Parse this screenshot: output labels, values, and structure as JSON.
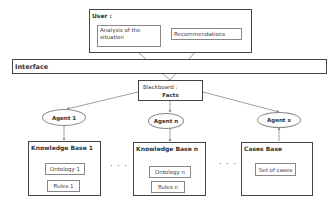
{
  "user": {
    "title": "User :",
    "analysis": "Analysis of  the situation",
    "recommendations": "Recommendations"
  },
  "interface": {
    "label": "Interface"
  },
  "blackboard": {
    "title": "Blackboard :",
    "subtitle": "Facts"
  },
  "agents": [
    {
      "label": "Agent 1"
    },
    {
      "label": "Agent n"
    },
    {
      "label": "Agent x"
    }
  ],
  "bases": [
    {
      "title": "Knowledge Base 1",
      "items": [
        "Ontology 1",
        "Rules 1"
      ]
    },
    {
      "title": "Knowledge Base n",
      "items": [
        "Ontology n",
        "Rules n"
      ]
    },
    {
      "title": "Cases Base",
      "items": [
        "Set of cases"
      ]
    }
  ],
  "ellipsis": "· · ·"
}
